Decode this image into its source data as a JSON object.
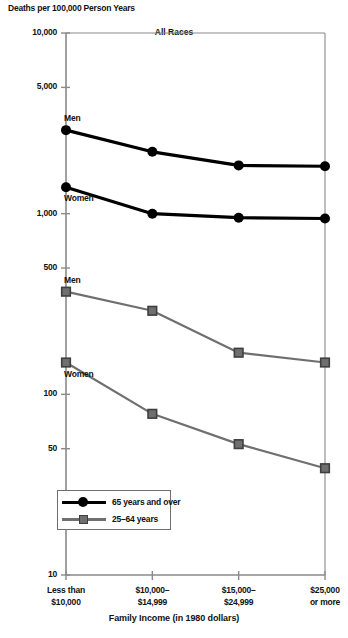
{
  "chart_data": {
    "type": "line",
    "title": "All Races",
    "ylabel": "Deaths per 100,000 Person Years",
    "xlabel": "Family Income (in 1980 dollars)",
    "categories": [
      "Less than\n$10,000",
      "$10,000–\n$14,999",
      "$15,000–\n$24,999",
      "$25,000\nor more"
    ],
    "category_lines": [
      [
        "Less than",
        "$10,000"
      ],
      [
        "$10,000–",
        "$14,999"
      ],
      [
        "$15,000–",
        "$24,999"
      ],
      [
        "$25,000",
        "or more"
      ]
    ],
    "yscale": "log",
    "ylim": [
      10,
      10000
    ],
    "yticks": [
      10,
      50,
      100,
      500,
      1000,
      5000,
      10000
    ],
    "ytick_labels": [
      "10",
      "50",
      "100",
      "500",
      "1,000",
      "5,000",
      "10,000"
    ],
    "grid": false,
    "legend_position": "lower-left-inside",
    "legend": [
      {
        "label": "65 years and over",
        "marker": "circle",
        "color": "#000000"
      },
      {
        "label": "25–64 years",
        "marker": "square",
        "color": "#6f6f6f"
      }
    ],
    "series": [
      {
        "name": "Men, 65 years and over",
        "group": "65 years and over",
        "annotation": "Men",
        "color": "#000000",
        "marker": "circle",
        "values": [
          2900,
          2200,
          1850,
          1830
        ]
      },
      {
        "name": "Women, 65 years and over",
        "group": "65 years and over",
        "annotation": "Women",
        "color": "#000000",
        "marker": "circle",
        "values": [
          1400,
          1000,
          950,
          940
        ]
      },
      {
        "name": "Men, 25–64 years",
        "group": "25–64 years",
        "annotation": "Men",
        "color": "#6f6f6f",
        "marker": "square",
        "values": [
          370,
          290,
          170,
          150
        ]
      },
      {
        "name": "Women, 25–64 years",
        "group": "25–64 years",
        "annotation": "Women",
        "color": "#6f6f6f",
        "marker": "square",
        "values": [
          150,
          78,
          53,
          39
        ]
      }
    ],
    "annotations": [
      {
        "text": "Men",
        "series": "Men, 65 years and over"
      },
      {
        "text": "Women",
        "series": "Women, 65 years and over"
      },
      {
        "text": "Men",
        "series": "Men, 25–64 years"
      },
      {
        "text": "Women",
        "series": "Women, 25–64 years"
      }
    ]
  }
}
